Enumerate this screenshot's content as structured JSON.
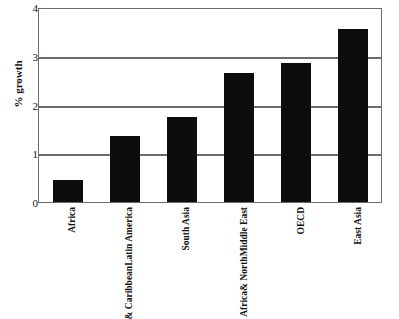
{
  "chart_data": {
    "type": "bar",
    "title": "",
    "subtitle": "",
    "xlabel": "",
    "ylabel": "% growth",
    "ylim": [
      0,
      4
    ],
    "yticks": [
      0,
      1,
      2,
      3,
      4
    ],
    "ytick_labels": [
      "0",
      "1",
      "2",
      "3",
      "4"
    ],
    "grid": true,
    "grid_axis": "y",
    "legend": false,
    "legend_position": "none",
    "bar_color": "#0d0d0d",
    "frame_color": "#6b6b6b",
    "categories": [
      "Africa",
      "Latin America & Caribbean",
      "South Asia",
      "Middle East & North Africa",
      "OECD",
      "East Asia"
    ],
    "category_lines": [
      [
        "Africa"
      ],
      [
        "Latin America",
        "& Caribbean"
      ],
      [
        "South Asia"
      ],
      [
        "Middle East",
        "& North",
        "Africa"
      ],
      [
        "OECD"
      ],
      [
        "East Asia"
      ]
    ],
    "values": [
      0.45,
      1.35,
      1.75,
      2.65,
      2.85,
      3.55
    ]
  }
}
